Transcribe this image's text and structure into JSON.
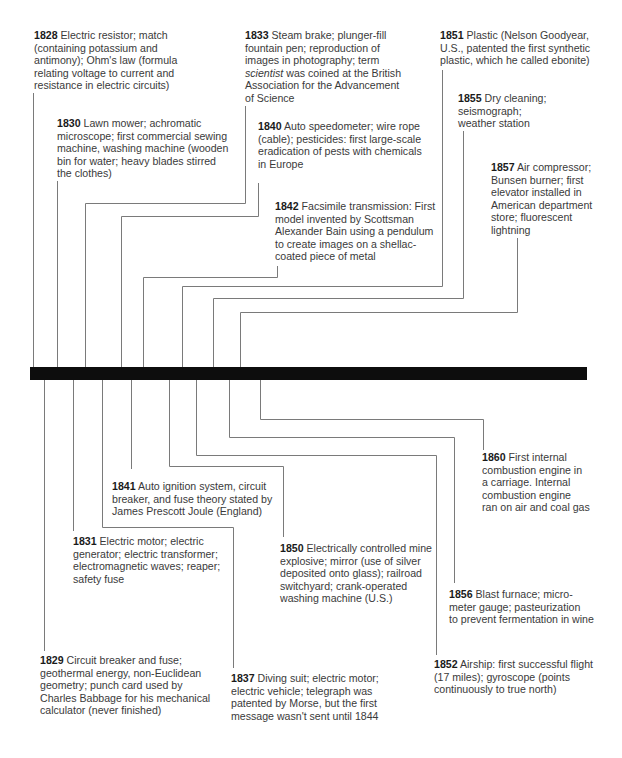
{
  "diagram": {
    "type": "timeline",
    "range": "1828–1860",
    "above": [
      {
        "year": "1828",
        "text": "Electric resistor; match\n(containing potassium and\nantimony); Ohm's law (formula\nrelating voltage to current and\nresistance in electric circuits)"
      },
      {
        "year": "1830",
        "text": "Lawn mower; achromatic\nmicroscope; first commercial sewing\nmachine, washing machine (wooden\nbin for water; heavy blades stirred\nthe clothes)"
      },
      {
        "year": "1833",
        "text_before": "Steam brake; plunger-fill\nfountain pen; reproduction of\nimages in photography; term\n",
        "italic": "scientist",
        "text_after": " was coined at the British\nAssociation for the Advancement\nof Science"
      },
      {
        "year": "1840",
        "text": "Auto speedometer; wire rope\n(cable); pesticides: first large-scale\neradication of pests with chemicals\nin Europe"
      },
      {
        "year": "1842",
        "text": "Facsimile transmission: First\nmodel invented by Scottsman\nAlexander Bain using a pendulum\nto create images on a shellac-\ncoated piece of metal"
      },
      {
        "year": "1851",
        "text": "Plastic (Nelson Goodyear,\nU.S., patented the first synthetic\nplastic, which he called ebonite)"
      },
      {
        "year": "1855",
        "text": "Dry cleaning;\nseismograph;\nweather station"
      },
      {
        "year": "1857",
        "text": "Air compressor;\nBunsen burner; first\nelevator installed in\nAmerican department\nstore; fluorescent\nlightning"
      }
    ],
    "below": [
      {
        "year": "1860",
        "text": "First internal\ncombustion engine in\na carriage. Internal\ncombustion engine\nran on air and coal gas"
      },
      {
        "year": "1841",
        "text": "Auto ignition system, circuit\nbreaker, and fuse theory stated by\nJames Prescott Joule (England)"
      },
      {
        "year": "1831",
        "text": "Electric motor; electric\ngenerator; electric transformer;\nelectromagnetic waves; reaper;\nsafety fuse"
      },
      {
        "year": "1850",
        "text": "Electrically controlled mine\nexplosive; mirror (use of silver\ndeposited onto glass); railroad\nswitchyard; crank-operated\nwashing machine (U.S.)"
      },
      {
        "year": "1856",
        "text": "Blast furnace; micro-\nmeter gauge; pasteurization\nto prevent fermentation in wine"
      },
      {
        "year": "1852",
        "text": "Airship: first successful flight\n(17 miles); gyroscope (points\ncontinuously to true north)"
      },
      {
        "year": "1829",
        "text": "Circuit breaker and fuse;\ngeothermal energy, non-Euclidean\ngeometry; punch card used by\nCharles Babbage for his mechanical\ncalculator (never finished)"
      },
      {
        "year": "1837",
        "text": "Diving suit; electric motor;\nelectric vehicle; telegraph was\npatented by Morse, but the first\nmessage wasn't sent until 1844"
      }
    ]
  }
}
